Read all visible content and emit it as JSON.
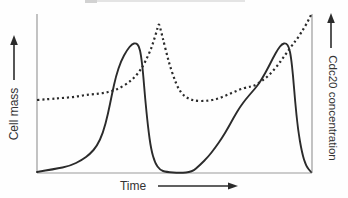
{
  "chart_data": {
    "type": "line",
    "title": "",
    "xlabel": "Time",
    "left_axis_label": "Cell mass",
    "right_axis_label": "Cdc20 concentration",
    "axes_numeric_labels_shown": false,
    "legend_shown": false,
    "grid_shown": false,
    "colors": {
      "curve": "#2b2b2b",
      "axis": "#9a9a9a",
      "text": "#333333",
      "background": "#fefefe"
    },
    "layout": {
      "plot_left": 37,
      "plot_right": 312,
      "plot_top": 14,
      "plot_bottom": 173,
      "coordinate_units": "screen pixels, y increases downward",
      "left_arrow": "points up along left axis label",
      "right_arrow": "points up along right axis label",
      "bottom_arrow": "points right after Time label"
    },
    "series": [
      {
        "name": "Cell mass",
        "axis": "left",
        "line_style": "solid",
        "description": "sawtooth growth cycles: slow sigmoidal rise then abrupt drop, two cycles",
        "points": [
          [
            37,
            172
          ],
          [
            55,
            169
          ],
          [
            70,
            166
          ],
          [
            82,
            160
          ],
          [
            90,
            154
          ],
          [
            97,
            146
          ],
          [
            103,
            133
          ],
          [
            108,
            114
          ],
          [
            112,
            94
          ],
          [
            116,
            76
          ],
          [
            121,
            61
          ],
          [
            127,
            50
          ],
          [
            132,
            44
          ],
          [
            136,
            43
          ],
          [
            139,
            46
          ],
          [
            141,
            55
          ],
          [
            143,
            72
          ],
          [
            145,
            97
          ],
          [
            148,
            127
          ],
          [
            151,
            149
          ],
          [
            155,
            163
          ],
          [
            160,
            170
          ],
          [
            166,
            172
          ],
          [
            180,
            173
          ],
          [
            192,
            172
          ],
          [
            200,
            165
          ],
          [
            208,
            157
          ],
          [
            215,
            148
          ],
          [
            222,
            138
          ],
          [
            228,
            128
          ],
          [
            234,
            117
          ],
          [
            240,
            107
          ],
          [
            246,
            99
          ],
          [
            252,
            92
          ],
          [
            258,
            85
          ],
          [
            263,
            77
          ],
          [
            268,
            68
          ],
          [
            273,
            58
          ],
          [
            278,
            49
          ],
          [
            282,
            44
          ],
          [
            286,
            43
          ],
          [
            289,
            47
          ],
          [
            291,
            57
          ],
          [
            293,
            75
          ],
          [
            295,
            100
          ],
          [
            298,
            130
          ],
          [
            302,
            153
          ],
          [
            306,
            166
          ],
          [
            311,
            172
          ]
        ]
      },
      {
        "name": "Cdc20 concentration",
        "axis": "right",
        "line_style": "dotted",
        "description": "slow rise to sharp spike just after each cell-mass drop, then decay to plateau; second spike cut off at right axis",
        "points": [
          [
            37,
            100
          ],
          [
            50,
            99
          ],
          [
            62,
            98
          ],
          [
            74,
            97
          ],
          [
            85,
            95
          ],
          [
            95,
            94
          ],
          [
            104,
            93
          ],
          [
            112,
            91
          ],
          [
            120,
            88
          ],
          [
            128,
            83
          ],
          [
            134,
            78
          ],
          [
            139,
            72
          ],
          [
            143,
            66
          ],
          [
            147,
            58
          ],
          [
            151,
            49
          ],
          [
            154,
            40
          ],
          [
            157,
            30
          ],
          [
            158,
            26
          ],
          [
            159,
            24
          ],
          [
            160,
            27
          ],
          [
            162,
            35
          ],
          [
            164,
            43
          ],
          [
            167,
            55
          ],
          [
            170,
            66
          ],
          [
            174,
            78
          ],
          [
            178,
            88
          ],
          [
            183,
            95
          ],
          [
            189,
            99
          ],
          [
            196,
            101
          ],
          [
            205,
            101
          ],
          [
            213,
            100
          ],
          [
            220,
            98
          ],
          [
            227,
            95
          ],
          [
            234,
            92
          ],
          [
            241,
            89
          ],
          [
            248,
            87
          ],
          [
            254,
            86
          ],
          [
            260,
            82
          ],
          [
            266,
            78
          ],
          [
            272,
            72
          ],
          [
            278,
            65
          ],
          [
            283,
            58
          ],
          [
            288,
            51
          ],
          [
            293,
            44
          ],
          [
            297,
            39
          ],
          [
            301,
            33
          ],
          [
            304,
            28
          ],
          [
            307,
            23
          ],
          [
            309,
            19
          ],
          [
            311,
            15
          ]
        ]
      }
    ]
  }
}
